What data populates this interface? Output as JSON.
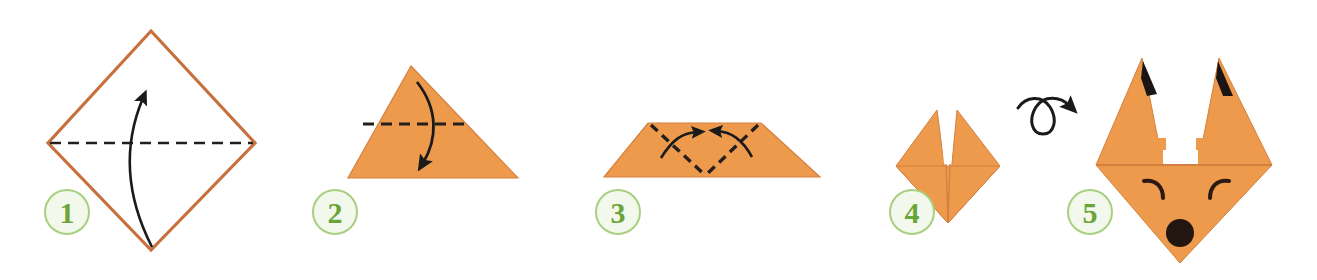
{
  "diagram": {
    "title": "Origami fox head folding instructions",
    "background_color": "#ffffff",
    "paper_color_front": "#ee9a4d",
    "paper_color_outline": "#c8703c",
    "crease_color": "#231f1d",
    "arrow_color": "#1a1a1a",
    "badge_fill": "#f3f8ec",
    "badge_ring": "#a8cf7f",
    "badge_text_color": "#6aa53a",
    "steps": [
      {
        "number": "1",
        "name": "step-1-valley-fold-diagonal",
        "shape": "white-diamond",
        "crease": "horizontal-dashed",
        "arrow": "curved-up",
        "badge_x": 67,
        "badge_y": 212
      },
      {
        "number": "2",
        "name": "step-2-fold-top-down",
        "shape": "orange-triangle",
        "crease": "horizontal-dashed",
        "arrow": "curved-down",
        "badge_x": 335,
        "badge_y": 212
      },
      {
        "number": "3",
        "name": "step-3-fold-corners-in",
        "shape": "orange-trapezoid",
        "crease": "v-shaped-dashed",
        "arrow": "two-curved-inward",
        "badge_x": 618,
        "badge_y": 212
      },
      {
        "number": "4",
        "name": "step-4-turn-over",
        "shape": "orange-diamond-with-ears",
        "crease": "none",
        "arrow": "flip-over-loop",
        "badge_x": 912,
        "badge_y": 212
      },
      {
        "number": "5",
        "name": "step-5-finished-fox",
        "shape": "fox-head",
        "crease": "horizontal",
        "arrow": "none",
        "badge_x": 1090,
        "badge_y": 212
      }
    ],
    "fox_face": {
      "ear_tip_color": "#1b1613",
      "eye_color": "#2b1a12",
      "nose_color": "#231510"
    }
  }
}
